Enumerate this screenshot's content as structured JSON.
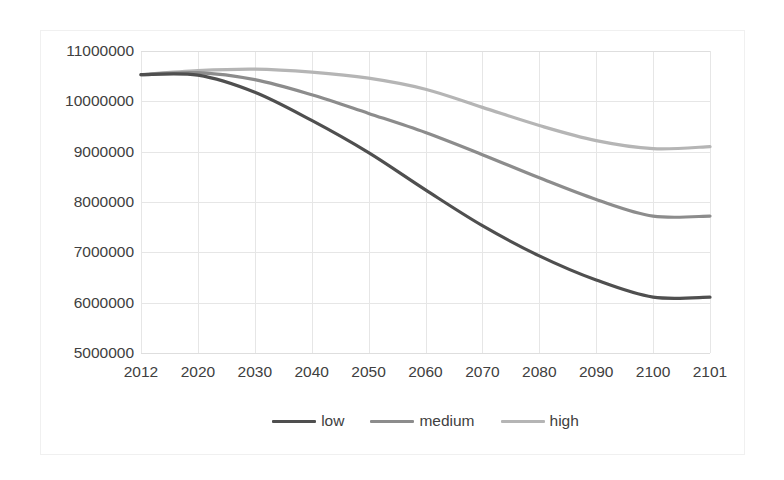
{
  "chart_data": {
    "type": "line",
    "title": "",
    "subtitle": "",
    "xlabel": "",
    "ylabel": "",
    "categories": [
      "2012",
      "2020",
      "2030",
      "2040",
      "2050",
      "2060",
      "2070",
      "2080",
      "2090",
      "2100",
      "2101"
    ],
    "x": [
      2012,
      2020,
      2030,
      2040,
      2050,
      2060,
      2070,
      2080,
      2090,
      2100,
      2101
    ],
    "xlim": [
      2012,
      2101
    ],
    "ylim": [
      5000000,
      11000000
    ],
    "yticks": [
      11000000,
      10000000,
      9000000,
      8000000,
      7000000,
      6000000,
      5000000
    ],
    "ytick_labels": [
      "11000000",
      "10000000",
      "9000000",
      "8000000",
      "7000000",
      "6000000",
      "5000000"
    ],
    "grid": true,
    "legend_position": "bottom",
    "series": [
      {
        "name": "low",
        "color": "#4f4f4f",
        "values": [
          10530000,
          10520000,
          10180000,
          9620000,
          8980000,
          8240000,
          7530000,
          6930000,
          6450000,
          6110000,
          6110000
        ]
      },
      {
        "name": "medium",
        "color": "#8c8c8c",
        "values": [
          10530000,
          10570000,
          10430000,
          10130000,
          9760000,
          9380000,
          8940000,
          8480000,
          8050000,
          7720000,
          7720000
        ]
      },
      {
        "name": "high",
        "color": "#b5b5b5",
        "values": [
          10530000,
          10610000,
          10640000,
          10580000,
          10460000,
          10240000,
          9880000,
          9520000,
          9220000,
          9060000,
          9100000
        ]
      }
    ]
  },
  "legend": {
    "entries": [
      {
        "label": "low"
      },
      {
        "label": "medium"
      },
      {
        "label": "high"
      }
    ]
  },
  "colors": {
    "low": "#4f4f4f",
    "medium": "#8c8c8c",
    "high": "#b5b5b5",
    "grid": "#e6e6e6",
    "frame": "#f0f0f0",
    "text": "#404040",
    "background": "#ffffff"
  }
}
